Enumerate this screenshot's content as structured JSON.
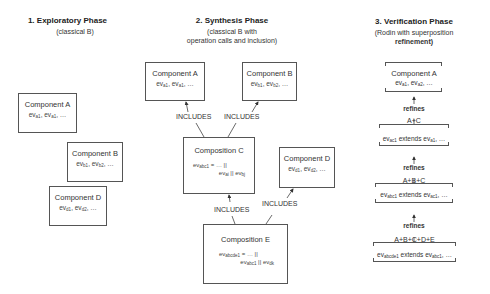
{
  "phases": [
    {
      "title": "1. Exploratory Phase",
      "subtitle_lines": [
        "(classical B)"
      ]
    },
    {
      "title": "2. Synthesis Phase",
      "subtitle_lines": [
        "(classical B with",
        "operation calls and inclusion)"
      ]
    },
    {
      "title": "3. Verification Phase",
      "subtitle_lines": [
        "(Rodin with superposition"
      ],
      "subtitle_bold": "refinement)"
    }
  ],
  "exploratory": {
    "components": [
      {
        "name": "Component A",
        "ev1": "a1",
        "ev2": "a1"
      },
      {
        "name": "Component B",
        "ev1": "b1",
        "ev2": "b2"
      },
      {
        "name": "Component D",
        "ev1": "d1",
        "ev2": "d2"
      }
    ]
  },
  "synthesis": {
    "component_a": {
      "name": "Component A",
      "ev1": "a1",
      "ev2": "a1"
    },
    "component_b": {
      "name": "Component B",
      "ev1": "b1",
      "ev2": "b2"
    },
    "composition_c": {
      "name": "Composition C",
      "lhs": "abc1",
      "rhs1": "ai",
      "rhs2": "bj"
    },
    "component_d": {
      "name": "Component D",
      "ev1": "d1",
      "ev2": "d2"
    },
    "composition_e": {
      "name": "Composition E",
      "lhs": "abcde1",
      "rhs1": "abc1",
      "rhs2": "dk"
    },
    "includes_label": "INCLUDES"
  },
  "verification": {
    "component_a": {
      "name": "Component A",
      "ev1": "a1",
      "ev2": "a2"
    },
    "refines_label": "refines",
    "levels": [
      {
        "name": "A+C",
        "extends_lhs": "ac1",
        "extends_rhs": "a1"
      },
      {
        "name": "A+B+C",
        "extends_lhs": "abc1",
        "extends_rhs": "ac1"
      },
      {
        "name": "A+B+C+D+E",
        "extends_lhs": "abcde1",
        "extends_rhs": "abc1"
      }
    ],
    "ev_prefix": "ev",
    "extends_word": "extends",
    "ellipsis": "…"
  },
  "common": {
    "ev": "ev",
    "sep": ", ",
    "ellipsis": "…",
    "assign": " = … ||",
    "par": " || "
  }
}
